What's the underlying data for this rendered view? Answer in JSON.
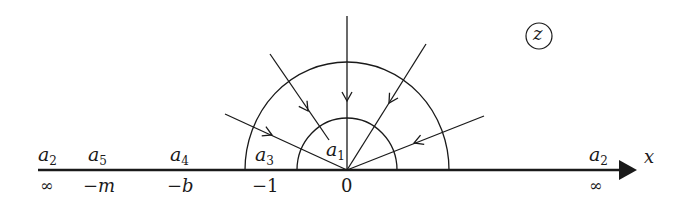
{
  "diagram": {
    "plane_label": "z",
    "axis_label": "x",
    "stroke_color": "#1a1a1a",
    "upper_labels": [
      {
        "sym": "a",
        "sub": "2",
        "x": 38,
        "y": 145
      },
      {
        "sym": "a",
        "sub": "5",
        "x": 88,
        "y": 145
      },
      {
        "sym": "a",
        "sub": "4",
        "x": 170,
        "y": 145
      },
      {
        "sym": "a",
        "sub": "3",
        "x": 255,
        "y": 145
      },
      {
        "sym": "a",
        "sub": "1",
        "x": 326,
        "y": 140
      },
      {
        "sym": "a",
        "sub": "2",
        "x": 589,
        "y": 145
      }
    ],
    "lower_labels": [
      {
        "text": "∞",
        "x": 40,
        "y": 178
      },
      {
        "text": "−m",
        "x": 83,
        "y": 177
      },
      {
        "text": "−b",
        "x": 167,
        "y": 177
      },
      {
        "text": "−1",
        "x": 252,
        "y": 177
      },
      {
        "text": "0",
        "x": 341,
        "y": 177
      },
      {
        "text": "∞",
        "x": 589,
        "y": 178
      }
    ]
  }
}
